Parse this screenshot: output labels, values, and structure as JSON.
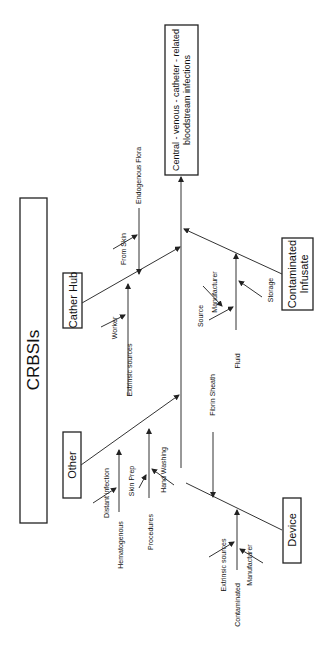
{
  "diagram": {
    "type": "fishbone",
    "orientation": "rotated-90-ccw",
    "title": "CRBSIs",
    "effect": {
      "line1": "Central - venous - catheter - related",
      "line2": "bloodstream infections"
    },
    "categories": {
      "cather_hub": {
        "label": "Cather Hub",
        "causes": {
          "from_skin": "From Skin",
          "endogenous_flora": "Endogenous Flora",
          "extrinsic_sources": "Extrinsic sources",
          "worker": "Worker"
        }
      },
      "contaminated_infusate": {
        "label1": "Contaminated",
        "label2": "Infusate",
        "causes": {
          "fluid": "Fluid",
          "source": "Source",
          "manufacturer": "Manufacturer",
          "storage": "Storage"
        }
      },
      "other": {
        "label": "Other",
        "causes": {
          "hematogenous": "Hematogenous",
          "distant_infection": "Distant infection",
          "procedures": "Procedures",
          "skin_prep": "Skin Prep",
          "hand_washing": "Hand Washing"
        }
      },
      "device": {
        "label": "Device",
        "causes": {
          "fibrin_sheath": "Fibrin Sheath",
          "contaminated": "Contaminated",
          "extrinsic_sources": "Extrinsic sources",
          "manufacturer": "Manufacturer"
        }
      }
    }
  }
}
